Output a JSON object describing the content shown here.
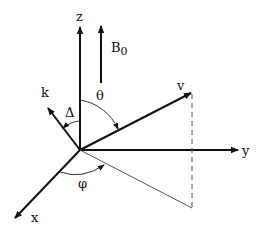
{
  "diagram": {
    "type": "vector-coordinate-diagram",
    "axes": {
      "x": {
        "label": "x"
      },
      "y": {
        "label": "y"
      },
      "z": {
        "label": "z"
      }
    },
    "vectors": {
      "B0": {
        "label": "B",
        "subscript": "0"
      },
      "k": {
        "label": "k"
      },
      "v": {
        "label": "v"
      }
    },
    "angles": {
      "theta": {
        "label": "θ"
      },
      "delta": {
        "label": "Δ"
      },
      "phi": {
        "label": "φ"
      }
    },
    "colors": {
      "stroke": "#111111",
      "thin_stroke": "#555555",
      "background": "#ffffff"
    }
  }
}
